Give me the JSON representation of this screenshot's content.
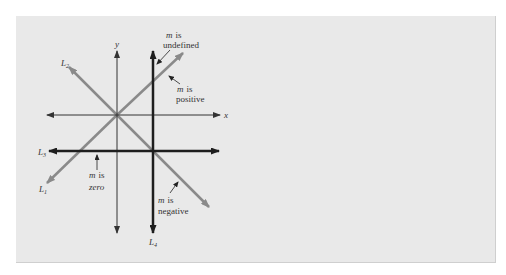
{
  "diagram": {
    "type": "slope-of-lines",
    "axes": {
      "x_label": "x",
      "y_label": "y"
    },
    "lines": [
      {
        "id": "L1",
        "label": "L",
        "subscript": "1",
        "description": "m is positive"
      },
      {
        "id": "L2",
        "label": "L",
        "subscript": "2",
        "description": "m is negative"
      },
      {
        "id": "L3",
        "label": "L",
        "subscript": "3",
        "description": "m is zero"
      },
      {
        "id": "L4",
        "label": "L",
        "subscript": "4",
        "description": "m is undefined"
      }
    ],
    "annotations": {
      "undefined": {
        "m": "m",
        "line1": "is",
        "line2": "undefined"
      },
      "positive": {
        "m": "m",
        "line1": "is",
        "line2": "positive"
      },
      "zero": {
        "m": "m",
        "line1": "is",
        "line2": "zero"
      },
      "negative": {
        "m": "m",
        "line1": "is",
        "line2": "negative"
      }
    },
    "colors": {
      "background": "#e9e9e9",
      "axis": "#333333",
      "diagonal_lines": "#8a8a8a",
      "bold_lines": "#1e1e1e"
    }
  }
}
